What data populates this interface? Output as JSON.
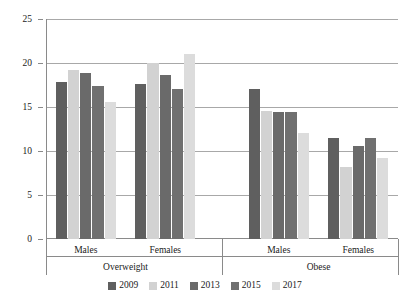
{
  "chart_data": {
    "type": "bar",
    "title": "",
    "xlabel": "",
    "ylabel": "",
    "ylim": [
      0,
      25
    ],
    "ytick_values": [
      0,
      5,
      10,
      15,
      20,
      25
    ],
    "ytick_labels": [
      "0",
      "5",
      "10",
      "15",
      "20",
      "25"
    ],
    "grid": true,
    "legend_position": "bottom",
    "categories": [
      "Males",
      "Females",
      "Males",
      "Females"
    ],
    "sections": [
      {
        "label": "Overweight",
        "categories": [
          "Males",
          "Females"
        ]
      },
      {
        "label": "Obese",
        "categories": [
          "Males",
          "Females"
        ]
      }
    ],
    "series": [
      {
        "name": "2009",
        "color": "#5f5f5f",
        "values": [
          17.8,
          17.6,
          17.0,
          11.5
        ]
      },
      {
        "name": "2011",
        "color": "#d2d2d2",
        "values": [
          19.2,
          20.0,
          14.5,
          8.2
        ]
      },
      {
        "name": "2013",
        "color": "#6a6a6a",
        "values": [
          18.9,
          18.6,
          14.4,
          10.6
        ]
      },
      {
        "name": "2015",
        "color": "#707070",
        "values": [
          17.4,
          17.0,
          14.4,
          11.5
        ]
      },
      {
        "name": "2017",
        "color": "#dcdcdc",
        "values": [
          15.6,
          21.0,
          12.0,
          9.2
        ]
      }
    ]
  },
  "legend": {
    "items": [
      {
        "label": "2009"
      },
      {
        "label": "2011"
      },
      {
        "label": "2013"
      },
      {
        "label": "2015"
      },
      {
        "label": "2017"
      }
    ]
  }
}
